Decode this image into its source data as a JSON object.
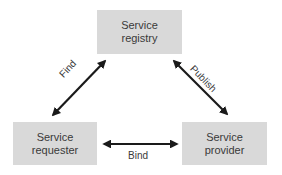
{
  "diagram": {
    "nodes": [
      {
        "id": "registry",
        "label": "Service\nregistry"
      },
      {
        "id": "requester",
        "label": "Service\nrequester"
      },
      {
        "id": "provider",
        "label": "Service\nprovider"
      }
    ],
    "edges": [
      {
        "from": "requester",
        "to": "registry",
        "label": "Find",
        "direction": "bidirectional"
      },
      {
        "from": "provider",
        "to": "registry",
        "label": "Publish",
        "direction": "bidirectional"
      },
      {
        "from": "requester",
        "to": "provider",
        "label": "Bind",
        "direction": "bidirectional"
      }
    ],
    "colors": {
      "box_fill": "#d9d9d9",
      "arrow": "#1a1a1a",
      "text": "#3a3a3a"
    }
  }
}
